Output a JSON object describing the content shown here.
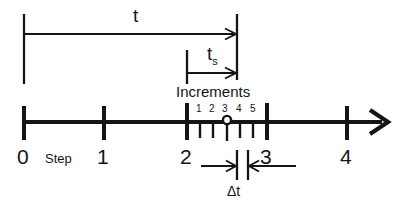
{
  "diagram": {
    "ink_color": "#151515",
    "background_color": "#ffffff",
    "axis": {
      "name": "time-axis",
      "arrow_end": "right",
      "major_ticks": [
        {
          "label": "0",
          "x": 24
        },
        {
          "label": "1",
          "x": 104
        },
        {
          "label": "2",
          "x": 187
        },
        {
          "label": "3",
          "x": 267
        },
        {
          "label": "4",
          "x": 347
        }
      ],
      "step_label": "Step"
    },
    "increments": {
      "heading": "Increments",
      "numbers": [
        "1",
        "2",
        "3",
        "4",
        "5"
      ],
      "tick_x": [
        200,
        213,
        227,
        240,
        253
      ],
      "current_marker_x": 227,
      "current_marker": "circle"
    },
    "measures": [
      {
        "name": "t",
        "label": "t",
        "subscript": "",
        "from_x": 24,
        "to_x": 237,
        "y": 33
      },
      {
        "name": "ts",
        "label": "t",
        "subscript": "s",
        "from_x": 187,
        "to_x": 237,
        "y": 73
      },
      {
        "name": "dt",
        "label": "Δt",
        "subscript": "",
        "from_x": 201,
        "to_x": 237,
        "y": 165
      }
    ]
  }
}
